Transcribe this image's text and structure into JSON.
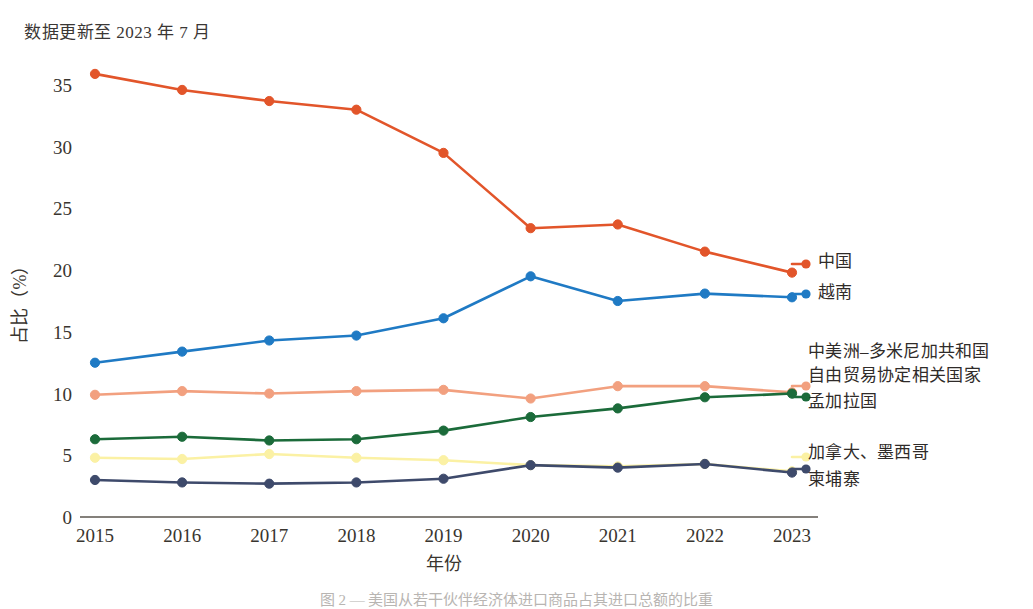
{
  "annotation": {
    "update_note": "数据更新至 2023 年 7 月"
  },
  "caption": {
    "text": "图 2 — 美国从若干伙伴经济体进口商品占其进口总额的比重"
  },
  "chart_data": {
    "type": "line",
    "title": "",
    "subtitle": "数据更新至 2023 年 7 月",
    "xlabel": "年份",
    "ylabel": "占比（%）",
    "categories": [
      "2015",
      "2016",
      "2017",
      "2018",
      "2019",
      "2020",
      "2021",
      "2022",
      "2023"
    ],
    "x": [
      2015,
      2016,
      2017,
      2018,
      2019,
      2020,
      2021,
      2022,
      2023
    ],
    "xlim": [
      2015,
      2023
    ],
    "ylim": [
      0,
      36.5
    ],
    "yticks": [
      0,
      5,
      10,
      15,
      20,
      25,
      30,
      35
    ],
    "grid": false,
    "legend_position": "right",
    "series": [
      {
        "name": "中国",
        "color": "#e2552a",
        "marker_color": "#e2552a",
        "values": [
          35.9,
          34.6,
          33.7,
          33.0,
          29.5,
          23.4,
          23.7,
          21.5,
          19.8
        ]
      },
      {
        "name": "越南",
        "color": "#1f7ac4",
        "marker_color": "#1f7ac4",
        "values": [
          12.5,
          13.4,
          14.3,
          14.7,
          16.1,
          19.5,
          17.5,
          18.1,
          17.8
        ]
      },
      {
        "name": "中美洲–多米尼加共和国自由贸易协定相关国家",
        "color": "#f2a07f",
        "marker_color": "#f2a07f",
        "values": [
          9.9,
          10.2,
          10.0,
          10.2,
          10.3,
          9.6,
          10.6,
          10.6,
          10.1
        ]
      },
      {
        "name": "孟加拉国",
        "color": "#1b6b3a",
        "marker_color": "#1b6b3a",
        "values": [
          6.3,
          6.5,
          6.2,
          6.3,
          7.0,
          8.1,
          8.8,
          9.7,
          10.0
        ]
      },
      {
        "name": "加拿大、墨西哥",
        "color": "#fbf1a4",
        "marker_color": "#fbf1a4",
        "values": [
          4.8,
          4.7,
          5.1,
          4.8,
          4.6,
          4.2,
          4.1,
          4.3,
          3.7
        ]
      },
      {
        "name": "柬埔寨",
        "color": "#3e4a6b",
        "marker_color": "#3e4a6b",
        "values": [
          3.0,
          2.8,
          2.7,
          2.8,
          3.1,
          4.2,
          4.0,
          4.3,
          3.6
        ]
      }
    ]
  },
  "legend": {
    "groups": [
      {
        "label": "中国",
        "color": "#e2552a"
      },
      {
        "label": "越南",
        "color": "#1f7ac4"
      },
      {
        "label": "中美洲–多米尼加共和国",
        "color": "#f2a07f"
      },
      {
        "label": "自由贸易协定相关国家",
        "color": "#f2a07f"
      },
      {
        "label": "孟加拉国",
        "color": "#1b6b3a"
      },
      {
        "label": "加拿大、墨西哥",
        "color": "#fbf1a4"
      },
      {
        "label": "柬埔寨",
        "color": "#3e4a6b"
      }
    ],
    "line1": "中国",
    "line2": "越南",
    "line3": "中美洲–多米尼加共和国",
    "line4": "自由贸易协定相关国家",
    "line5": "孟加拉国",
    "line6": "加拿大、墨西哥",
    "line7": "柬埔寨"
  },
  "axes": {
    "y_label": "占比（%）",
    "x_label": "年份"
  }
}
